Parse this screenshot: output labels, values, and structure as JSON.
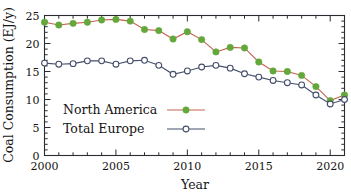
{
  "chart_data": {
    "type": "line",
    "title": "",
    "xlabel": "Year",
    "ylabel": "Coal Consumption (EJ/y)",
    "xlim": [
      2000,
      2021
    ],
    "ylim": [
      0,
      25
    ],
    "xticks": [
      2000,
      2005,
      2010,
      2015,
      2020
    ],
    "xtick_labels": [
      "2000",
      "2005",
      "2010",
      "2015",
      "2020"
    ],
    "yticks": [
      0,
      5,
      10,
      15,
      20,
      25
    ],
    "ytick_labels": [
      "0",
      "5",
      "10",
      "15",
      "20",
      "25"
    ],
    "x_minor_tick_interval": 1,
    "y_minor_tick_interval": 1,
    "grid": false,
    "legend_position": "lower-left-inside",
    "x": [
      2000,
      2001,
      2002,
      2003,
      2004,
      2005,
      2006,
      2007,
      2008,
      2009,
      2010,
      2011,
      2012,
      2013,
      2014,
      2015,
      2016,
      2017,
      2018,
      2019,
      2020,
      2021
    ],
    "series": [
      {
        "name": "North America",
        "line_color": "#c4624f",
        "marker_color": "#63a83a",
        "marker": "filled-circle",
        "values": [
          23.8,
          23.3,
          23.6,
          23.8,
          24.2,
          24.3,
          24.0,
          22.5,
          22.3,
          20.8,
          22.1,
          20.7,
          18.5,
          19.3,
          19.2,
          16.7,
          15.1,
          15.0,
          14.3,
          12.3,
          9.8,
          10.8
        ]
      },
      {
        "name": "Total Europe",
        "line_color": "#454f6b",
        "marker_color": "#ffffff",
        "marker": "open-circle",
        "values": [
          16.5,
          16.3,
          16.4,
          16.9,
          16.9,
          16.3,
          16.9,
          17.0,
          16.1,
          14.5,
          15.1,
          15.8,
          16.1,
          15.6,
          14.6,
          14.0,
          13.4,
          13.0,
          12.6,
          10.8,
          9.2,
          10.0
        ]
      }
    ]
  },
  "legend": {
    "entries": [
      {
        "label": "North America"
      },
      {
        "label": "Total Europe"
      }
    ]
  }
}
